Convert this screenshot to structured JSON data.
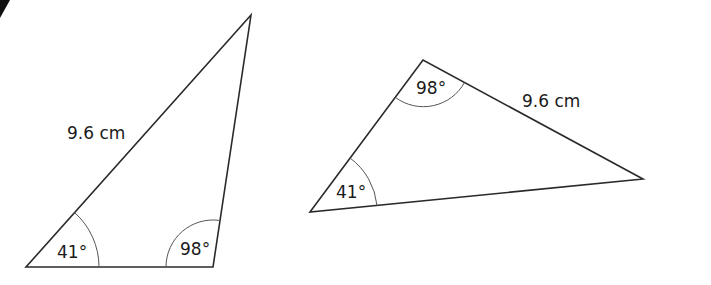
{
  "figure": {
    "triangles": [
      {
        "id": "left",
        "vertices": [
          [
            26,
            267
          ],
          [
            213,
            267
          ],
          [
            251,
            15
          ]
        ],
        "angles": [
          {
            "vertex": "bottom-left",
            "label": "41°"
          },
          {
            "vertex": "bottom-right",
            "label": "98°"
          }
        ],
        "side": {
          "between": "bottom-left to top",
          "label": "9.6 cm"
        }
      },
      {
        "id": "right",
        "vertices": [
          [
            310,
            212
          ],
          [
            423,
            60
          ],
          [
            643,
            179
          ]
        ],
        "angles": [
          {
            "vertex": "left",
            "label": "41°"
          },
          {
            "vertex": "top",
            "label": "98°"
          }
        ],
        "side": {
          "between": "top to right",
          "label": "9.6 cm"
        }
      }
    ]
  },
  "labels": {
    "left_side": "9.6 cm",
    "left_angle_a": "41°",
    "left_angle_b": "98°",
    "right_side": "9.6 cm",
    "right_angle_a": "41°",
    "right_angle_b": "98°"
  },
  "colors": {
    "line": "#2a2a2a",
    "arc": "#555555",
    "text": "#1a1a1a",
    "background": "#ffffff"
  }
}
